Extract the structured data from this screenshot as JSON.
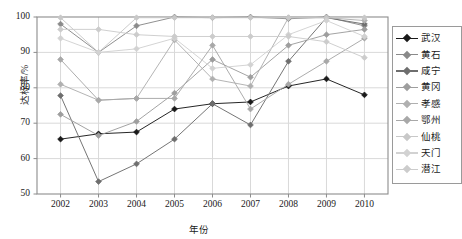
{
  "chart_data": {
    "type": "line",
    "title": "",
    "xlabel": "年份",
    "ylabel": "达标率/%",
    "grid": true,
    "legend_position": "right",
    "categories": [
      "2002",
      "2003",
      "2004",
      "2005",
      "2006",
      "2007",
      "2008",
      "2009",
      "2010"
    ],
    "x": [
      2002,
      2003,
      2004,
      2005,
      2006,
      2007,
      2008,
      2009,
      2010
    ],
    "xlim": [
      2001.6,
      2010.4
    ],
    "ylim": [
      50,
      100
    ],
    "yticks": [
      50,
      60,
      70,
      80,
      90,
      100
    ],
    "series": [
      {
        "name": "武汉",
        "color": "#1a1a1a",
        "values": [
          65.5,
          67.0,
          67.5,
          74.0,
          75.5,
          76.0,
          80.5,
          82.5,
          78.0
        ]
      },
      {
        "name": "黄石",
        "color": "#8a8a8a",
        "values": [
          98.0,
          90.0,
          97.5,
          100.0,
          99.8,
          100.0,
          99.5,
          100.0,
          97.5
        ]
      },
      {
        "name": "咸宁",
        "color": "#6e6e6e",
        "values": [
          77.8,
          53.5,
          58.5,
          65.5,
          75.5,
          69.5,
          87.5,
          99.8,
          98.0
        ]
      },
      {
        "name": "黄冈",
        "color": "#9e9e9e",
        "values": [
          72.5,
          66.5,
          70.5,
          78.5,
          88.0,
          83.0,
          92.0,
          95.0,
          96.5
        ]
      },
      {
        "name": "孝感",
        "color": "#b0b0b0",
        "values": [
          81.0,
          76.5,
          77.0,
          93.5,
          82.5,
          80.5,
          99.8,
          99.8,
          99.0
        ]
      },
      {
        "name": "鄂州",
        "color": "#a8a8a8",
        "values": [
          88.0,
          76.5,
          77.0,
          77.0,
          92.0,
          74.0,
          81.0,
          87.5,
          94.0
        ]
      },
      {
        "name": "仙桃",
        "color": "#c8c8c8",
        "values": [
          99.8,
          90.0,
          99.8,
          99.8,
          99.8,
          99.8,
          99.8,
          99.8,
          99.8
        ]
      },
      {
        "name": "天门",
        "color": "#d2d2d2",
        "values": [
          94.0,
          90.0,
          91.0,
          94.0,
          85.5,
          86.5,
          95.0,
          99.0,
          94.5
        ]
      },
      {
        "name": "潜江",
        "color": "#cccccc",
        "values": [
          96.5,
          96.5,
          95.0,
          94.5,
          94.5,
          94.5,
          94.5,
          93.0,
          88.5
        ]
      }
    ]
  },
  "axis": {
    "y_ticks": [
      "100",
      "90",
      "80",
      "70",
      "60",
      "50"
    ],
    "x_ticks": [
      "2002",
      "2003",
      "2004",
      "2005",
      "2006",
      "2007",
      "2008",
      "2009",
      "2010"
    ],
    "y_title": "达标率/%",
    "x_title": "年份"
  },
  "legend": {
    "items": [
      {
        "label": "武汉"
      },
      {
        "label": "黄石"
      },
      {
        "label": "咸宁"
      },
      {
        "label": "黄冈"
      },
      {
        "label": "孝感"
      },
      {
        "label": "鄂州"
      },
      {
        "label": "仙桃"
      },
      {
        "label": "天门"
      },
      {
        "label": "潜江"
      }
    ]
  },
  "colors": {
    "plot_border": "#8c8c8c",
    "gridline": "#d9d9d9",
    "background": "#ffffff"
  }
}
